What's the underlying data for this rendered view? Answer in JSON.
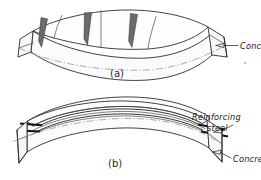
{
  "figure": {
    "background_color": "#ffffff",
    "line_color": "#2e2e2e",
    "crack_fill_color": "#6b6b6b",
    "rebar_color": "#101010",
    "centerline_color": "#8a8a8a"
  },
  "panels": [
    {
      "id": "a",
      "caption": "(a)",
      "description": "Plain concrete beam, sagging, with three tension cracks on the top surface",
      "labels": [
        {
          "id": "concrete-a",
          "text": "Concrete",
          "style": "italic",
          "target": "right end face of beam a"
        }
      ],
      "crack_count": 3
    },
    {
      "id": "b",
      "caption": "(b)",
      "description": "Reinforced concrete beam, hogging, with reinforcing steel bars near the top protruding from both ends",
      "labels": [
        {
          "id": "reinforcing-steel-b",
          "text": "Reinforcing",
          "text_line2": "steel",
          "style": "italic",
          "target": "steel bars at right end of beam b"
        },
        {
          "id": "concrete-b",
          "text": "Concrete",
          "style": "italic",
          "target": "right end face of beam b"
        }
      ],
      "rebar_count": 2
    }
  ]
}
